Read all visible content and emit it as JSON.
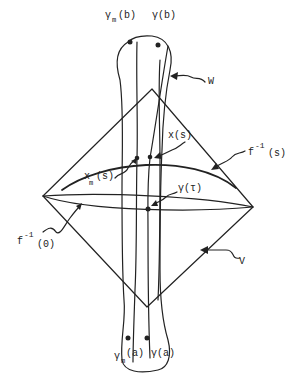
{
  "diagram": {
    "labels": {
      "gamma_m_b": {
        "main": "γ",
        "sub": "m",
        "arg": "(b)"
      },
      "gamma_b": "γ(b)",
      "W": "W",
      "x_s": "x(s)",
      "x_m_s": {
        "main": "x",
        "sub": "m",
        "arg": "(s)"
      },
      "f_inv_s": {
        "main": "f",
        "sup": "-1",
        "arg": "(s)"
      },
      "gamma_tau": "γ(τ)",
      "f_inv_0": {
        "main": "f",
        "sup": "-1",
        "arg": "(0)"
      },
      "V": "V",
      "gamma_m_a": {
        "main": "γ",
        "sub": "m",
        "arg": "(a)"
      },
      "gamma_a": "γ(a)"
    },
    "colors": {
      "ink": "#222222",
      "background": "#ffffff"
    }
  }
}
